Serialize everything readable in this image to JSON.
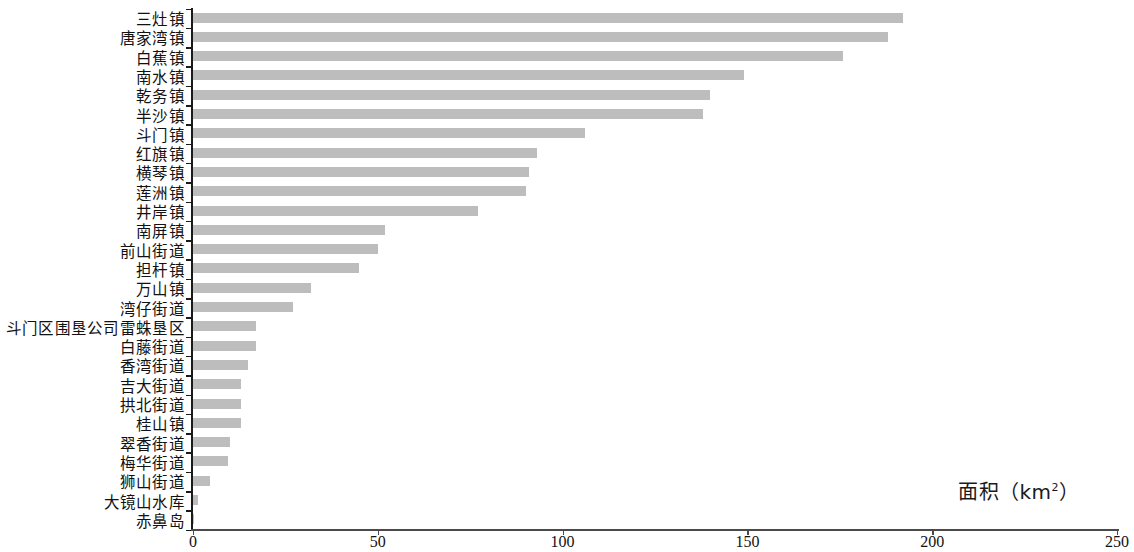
{
  "chart_data": {
    "type": "bar",
    "orientation": "horizontal",
    "title": "",
    "subtitle": "",
    "xlabel": "面积（km²）",
    "ylabel": "",
    "xlim": [
      0,
      250
    ],
    "xticks": [
      0,
      50,
      100,
      150,
      200,
      250
    ],
    "xtick_labels": [
      "0",
      "50",
      "100",
      "150",
      "200",
      "250"
    ],
    "grid": false,
    "legend": null,
    "bar_color": "#bdbdbd",
    "axis_color": "#1a1a1a",
    "categories": [
      "三灶镇",
      "唐家湾镇",
      "白蕉镇",
      "南水镇",
      "乾务镇",
      "半沙镇",
      "斗门镇",
      "红旗镇",
      "横琴镇",
      "莲洲镇",
      "井岸镇",
      "南屏镇",
      "前山街道",
      "担杆镇",
      "万山镇",
      "湾仔街道",
      "斗门区围垦公司雷蛛垦区",
      "白藤街道",
      "香湾街道",
      "吉大街道",
      "拱北街道",
      "桂山镇",
      "翠香街道",
      "梅华街道",
      "狮山街道",
      "大镜山水库",
      "赤鼻岛"
    ],
    "values": [
      192,
      188,
      176,
      149,
      140,
      138,
      106,
      93,
      91,
      90,
      77,
      52,
      50,
      45,
      32,
      27,
      17,
      17,
      15,
      13,
      13,
      13,
      10,
      9.5,
      4.6,
      1.4,
      0.2
    ]
  },
  "axis": {
    "x_title_text": "面积（km",
    "x_title_sup": "2",
    "x_title_tail": "）"
  }
}
